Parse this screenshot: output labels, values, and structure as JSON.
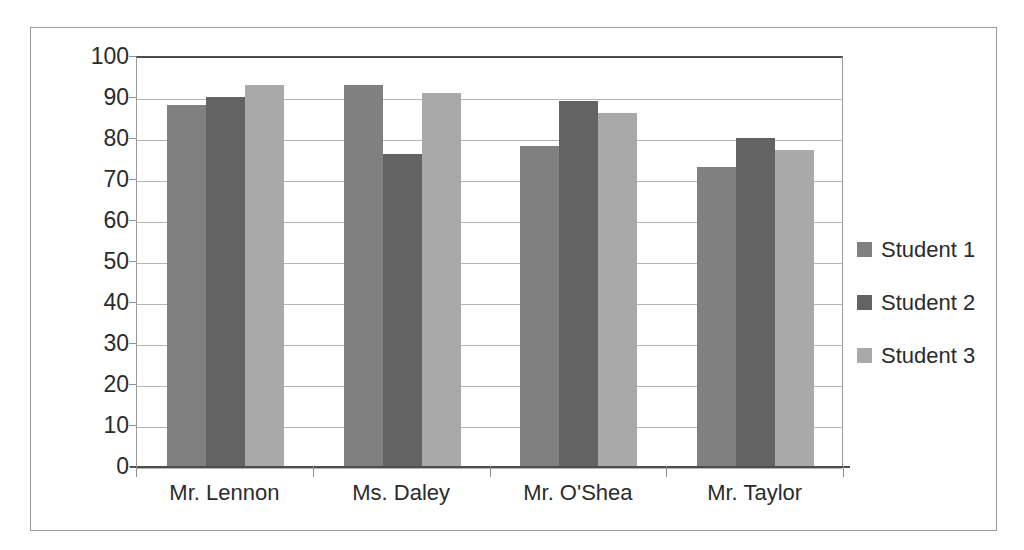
{
  "chart_data": {
    "type": "bar",
    "title": "",
    "subtitle": "",
    "xlabel": "",
    "ylabel": "",
    "categories": [
      "Mr. Lennon",
      "Ms. Daley",
      "Mr. O'Shea",
      "Mr. Taylor"
    ],
    "series": [
      {
        "name": "Student 1",
        "color": "#808080",
        "values": [
          88,
          93,
          78,
          73
        ]
      },
      {
        "name": "Student 2",
        "color": "#636363",
        "values": [
          90,
          76,
          89,
          80
        ]
      },
      {
        "name": "Student 3",
        "color": "#a9a9a9",
        "values": [
          93,
          91,
          86,
          77
        ]
      }
    ],
    "ylim": [
      0,
      100
    ],
    "ytick_step": 10,
    "yticks": [
      100,
      90,
      80,
      70,
      60,
      50,
      40,
      30,
      20,
      10,
      0
    ],
    "ytick_labels": [
      "100",
      "90",
      "80",
      "70",
      "60",
      "50",
      "40",
      "30",
      "20",
      "10",
      "0"
    ],
    "grid": "horizontal",
    "legend_position": "right",
    "plot_border": true,
    "background_color": "#ffffff",
    "axis_color": "#4d4d4d",
    "gridline_color": "#b5b5b5"
  },
  "legend": {
    "items": [
      {
        "label": "Student 1",
        "color": "#808080"
      },
      {
        "label": "Student 2",
        "color": "#636363"
      },
      {
        "label": "Student 3",
        "color": "#a9a9a9"
      }
    ]
  }
}
